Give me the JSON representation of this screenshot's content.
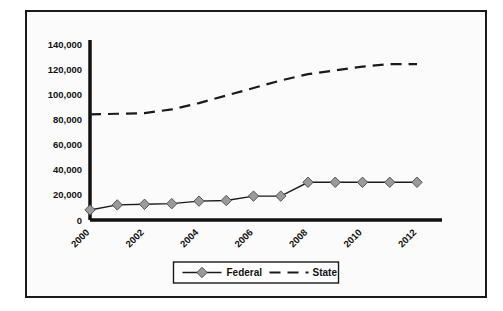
{
  "chart_data": {
    "type": "line",
    "title": "",
    "subtitle": "",
    "xlabel": "",
    "ylabel": "",
    "grid": false,
    "legend_position": "bottom",
    "xlim": [
      2000,
      2012
    ],
    "ylim": [
      0,
      140000
    ],
    "x": [
      2000,
      2001,
      2002,
      2003,
      2004,
      2005,
      2006,
      2007,
      2008,
      2009,
      2010,
      2011,
      2012
    ],
    "categories": [
      "2000",
      "2001",
      "2002",
      "2003",
      "2004",
      "2005",
      "2006",
      "2007",
      "2008",
      "2009",
      "2010",
      "2011",
      "2012"
    ],
    "xtick_labels": [
      "2000",
      "2002",
      "2004",
      "2006",
      "2008",
      "2010",
      "2012"
    ],
    "xtick_values": [
      2000,
      2002,
      2004,
      2006,
      2008,
      2010,
      2012
    ],
    "ytick_labels": [
      "0",
      "20,000",
      "40,000",
      "60,000",
      "80,000",
      "100,000",
      "120,000",
      "140,000"
    ],
    "ytick_values": [
      0,
      20000,
      40000,
      60000,
      80000,
      100000,
      120000,
      140000
    ],
    "series": [
      {
        "name": "Federal",
        "style": "solid",
        "marker": "diamond",
        "color": "#1a1a1a",
        "marker_color": "#9a9a9a",
        "values": [
          8000,
          12000,
          12500,
          13000,
          15000,
          15500,
          19000,
          19000,
          30000,
          30000,
          30000,
          30000,
          30000
        ]
      },
      {
        "name": "State",
        "style": "dashed",
        "marker": "none",
        "color": "#1a1a1a",
        "values": [
          84000,
          84500,
          85000,
          88000,
          93000,
          99000,
          105000,
          111000,
          116000,
          119000,
          122000,
          124000,
          124000
        ]
      }
    ]
  },
  "legend": {
    "items": [
      {
        "label": "Federal",
        "style": "solid",
        "marker": "diamond"
      },
      {
        "label": "State",
        "style": "dashed",
        "marker": "none"
      }
    ]
  },
  "colors": {
    "frame": "#1a1a1a",
    "axis": "#111111",
    "background": "#fbfbfb",
    "page_background": "#ffffff",
    "line": "#1a1a1a",
    "marker_fill": "#9a9a9a",
    "marker_stroke": "#4a4a4a"
  }
}
